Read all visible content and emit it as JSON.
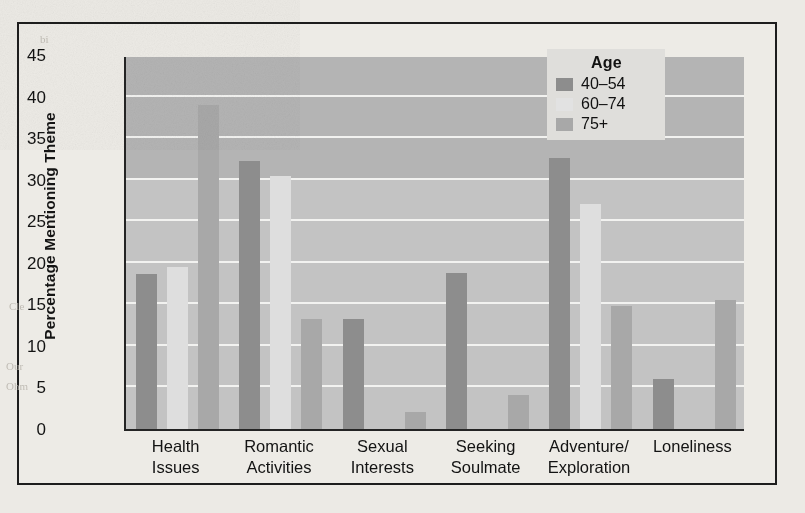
{
  "chart_data": {
    "type": "bar",
    "title": "",
    "xlabel": "",
    "ylabel": "Percentage Mentioning Theme",
    "categories": [
      "Health\nIssues",
      "Romantic\nActivities",
      "Sexual\nInterests",
      "Seeking\nSoulmate",
      "Adventure/\nExploration",
      "Loneliness"
    ],
    "category_lines": [
      [
        "Health",
        "Issues"
      ],
      [
        "Romantic",
        "Activities"
      ],
      [
        "Sexual",
        "Interests"
      ],
      [
        "Seeking",
        "Soulmate"
      ],
      [
        "Adventure/",
        "Exploration"
      ],
      [
        "Loneliness",
        ""
      ]
    ],
    "series": [
      {
        "name": "40–54",
        "color": "#8d8d8d",
        "values": [
          18.7,
          32.3,
          13.2,
          18.8,
          32.6,
          6.0
        ]
      },
      {
        "name": "60–74",
        "color": "#dedede",
        "values": [
          19.5,
          30.4,
          0,
          0,
          27.1,
          0
        ]
      },
      {
        "name": "75+",
        "color": "#a8a8a8",
        "values": [
          39.0,
          13.2,
          2.0,
          4.1,
          14.8,
          15.5
        ]
      }
    ],
    "ylim": [
      0,
      45
    ],
    "yticks": [
      0,
      5,
      10,
      15,
      20,
      25,
      30,
      35,
      40,
      45
    ],
    "ytick_labels": [
      "0",
      "5",
      "10",
      "15",
      "20",
      "25",
      "30",
      "35",
      "40",
      "45"
    ],
    "grid": true,
    "grid_axis": "y",
    "legend": {
      "title": "Age",
      "position": "top-right",
      "entries": [
        "40–54",
        "60–74",
        "75+"
      ]
    }
  },
  "figure": {
    "background_color": "#eceae5",
    "plot_background_color": "#b4b4b4",
    "plot_background_lower_color": "#c3c3c3",
    "gridline_color": "#f2f2f0",
    "axis_color": "#242424",
    "frame_color": "#1d1d1d"
  },
  "bleed_text": [
    "bi",
    "Cle",
    "Our",
    "Ohm"
  ]
}
